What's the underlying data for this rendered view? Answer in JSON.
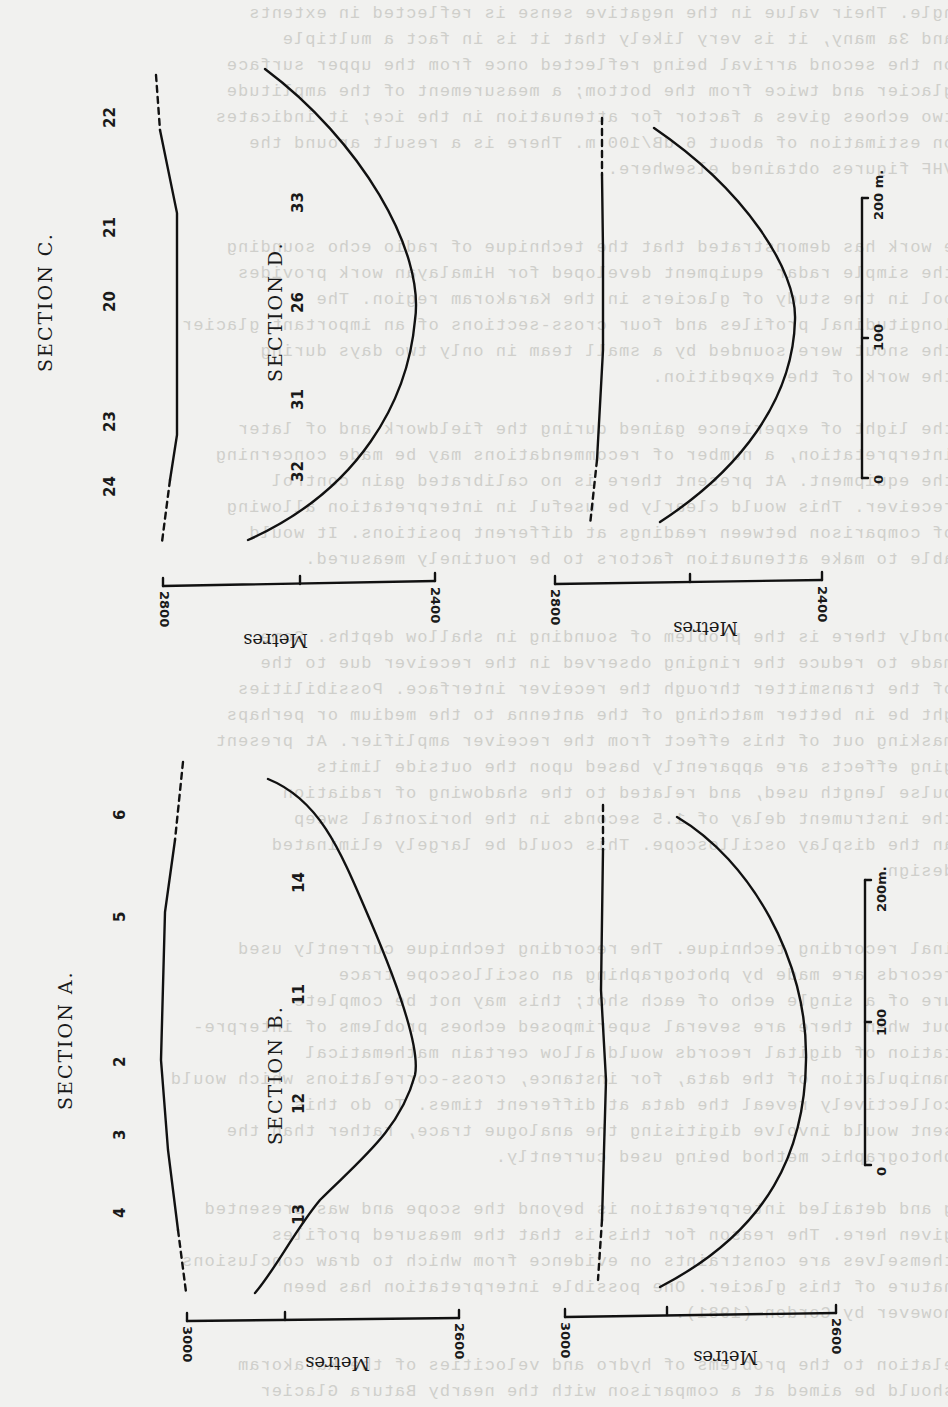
{
  "figure": {
    "scale_bar": {
      "ticks": [
        "0",
        "100",
        "200 m."
      ]
    },
    "sections": [
      {
        "id": "C",
        "title": "SECTION C.",
        "stations": [
          "22",
          "21",
          "20",
          "23",
          "24"
        ],
        "axis": {
          "label": "Metres",
          "ticks": [
            "2800",
            "2400"
          ]
        }
      },
      {
        "id": "D",
        "title": "SECTION D.",
        "stations": [
          "33",
          "26",
          "31",
          "32"
        ],
        "axis": {
          "label": "Metres",
          "ticks": [
            "2800",
            "2400"
          ]
        }
      },
      {
        "id": "A",
        "title": "SECTION A.",
        "stations": [
          "6",
          "5",
          "2",
          "3",
          "4"
        ],
        "axis": {
          "label": "Metres",
          "ticks": [
            "3000",
            "2600"
          ]
        }
      },
      {
        "id": "B",
        "title": "SECTION B.",
        "stations": [
          "14",
          "11",
          "12",
          "13"
        ],
        "axis": {
          "label": "Metres",
          "ticks": [
            "3000",
            "2600"
          ]
        }
      }
    ],
    "scale_bar_lower": {
      "ticks": [
        "0",
        "100",
        "200m."
      ]
    }
  }
}
